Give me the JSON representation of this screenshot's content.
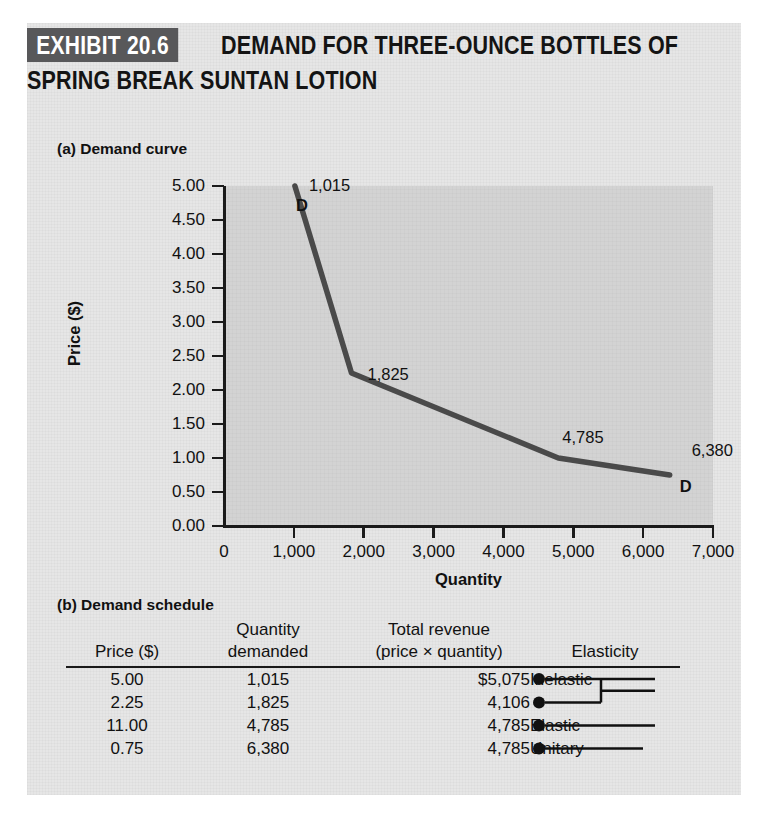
{
  "exhibit": {
    "badge": "EXHIBIT 20.6",
    "title_line1": "DEMAND FOR THREE-OUNCE BOTTLES OF",
    "title_line2": "SPRING BREAK SUNTAN LOTION",
    "badge_bg": "#58585a",
    "panel_bg": "#e6e6e6",
    "plot_bg": "#d3d3d3",
    "ink": "#1a1a1a"
  },
  "sections": {
    "a_caption": "(a) Demand curve",
    "b_caption": "(b) Demand schedule"
  },
  "chart_data": {
    "type": "line",
    "title": "Demand curve",
    "xlabel": "Quantity",
    "ylabel": "Price ($)",
    "xlim": [
      0,
      7000
    ],
    "ylim": [
      0,
      5.0
    ],
    "xticks": [
      0,
      1000,
      2000,
      3000,
      4000,
      5000,
      6000,
      7000
    ],
    "xticklabels": [
      "0",
      "1,000",
      "2,000",
      "3,000",
      "4,000",
      "5,000",
      "6,000",
      "7,000"
    ],
    "yticks": [
      0.0,
      0.5,
      1.0,
      1.5,
      2.0,
      2.5,
      3.0,
      3.5,
      4.0,
      4.5,
      5.0
    ],
    "yticklabels": [
      "0.00",
      "0.50",
      "1.00",
      "1.50",
      "2.00",
      "2.50",
      "3.00",
      "3.50",
      "4.00",
      "4.50",
      "5.00"
    ],
    "grid": false,
    "legend": null,
    "series": [
      {
        "name": "D",
        "color": "#4a4a4a",
        "x": [
          1015,
          1825,
          4785,
          6380
        ],
        "y": [
          5.0,
          2.25,
          1.0,
          0.75
        ]
      }
    ],
    "point_labels": [
      "1,015",
      "1,825",
      "4,785",
      "6,380"
    ],
    "curve_labels": [
      "D",
      "D"
    ]
  },
  "table": {
    "headers": {
      "price_l1": "",
      "price_l2": "Price ($)",
      "quantity_l1": "Quantity",
      "quantity_l2": "demanded",
      "revenue_l1": "Total revenue",
      "revenue_l2": "(price × quantity)",
      "elasticity_l1": "",
      "elasticity_l2": "Elasticity"
    },
    "rows": [
      {
        "price": "5.00",
        "quantity": "1,015",
        "revenue": "$5,075",
        "elasticity": "Inelastic"
      },
      {
        "price": "2.25",
        "quantity": "1,825",
        "revenue": "4,106",
        "elasticity": ""
      },
      {
        "price": "11.00",
        "quantity": "4,785",
        "revenue": "4,785",
        "elasticity": "Elastic"
      },
      {
        "price": "0.75",
        "quantity": "6,380",
        "revenue": "4,785",
        "elasticity": "Unitary"
      }
    ]
  }
}
